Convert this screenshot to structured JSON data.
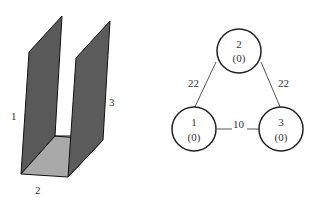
{
  "left_figure": {
    "description": "U-shaped channel of three plates",
    "labels": [
      {
        "id": "plate-1",
        "text": "1"
      },
      {
        "id": "plate-2",
        "text": "2"
      },
      {
        "id": "plate-3",
        "text": "3"
      }
    ],
    "colors": {
      "wall": "#5a5a5a",
      "floor": "#aaaaaa",
      "edge": "#111111"
    }
  },
  "graph": {
    "nodes": [
      {
        "id": "1",
        "label": "1",
        "value": "(0)"
      },
      {
        "id": "2",
        "label": "2",
        "value": "(0)"
      },
      {
        "id": "3",
        "label": "3",
        "value": "(0)"
      }
    ],
    "edges": [
      {
        "from": "1",
        "to": "2",
        "weight": "22"
      },
      {
        "from": "2",
        "to": "3",
        "weight": "22"
      },
      {
        "from": "1",
        "to": "3",
        "weight": "10"
      }
    ]
  }
}
